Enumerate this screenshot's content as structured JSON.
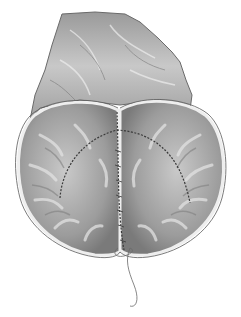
{
  "image": {
    "subject": "surgical-illustration",
    "description": "Grayscale medical illustration of a sutured organ: a rough, irregular tissue flap at top and a two-lobed folded structure with radial folds below, joined by running suture lines along a central seam and two curved arcs, with a loose suture thread trailing from the bottom.",
    "palette": {
      "background": "#ffffff",
      "tissue_light": "#d8d8d8",
      "tissue_mid": "#a8a8a8",
      "tissue_dark": "#6a6a6a",
      "rim": "#ededed",
      "suture": "#3a3a3a",
      "outline": "#5a5a5a"
    }
  }
}
